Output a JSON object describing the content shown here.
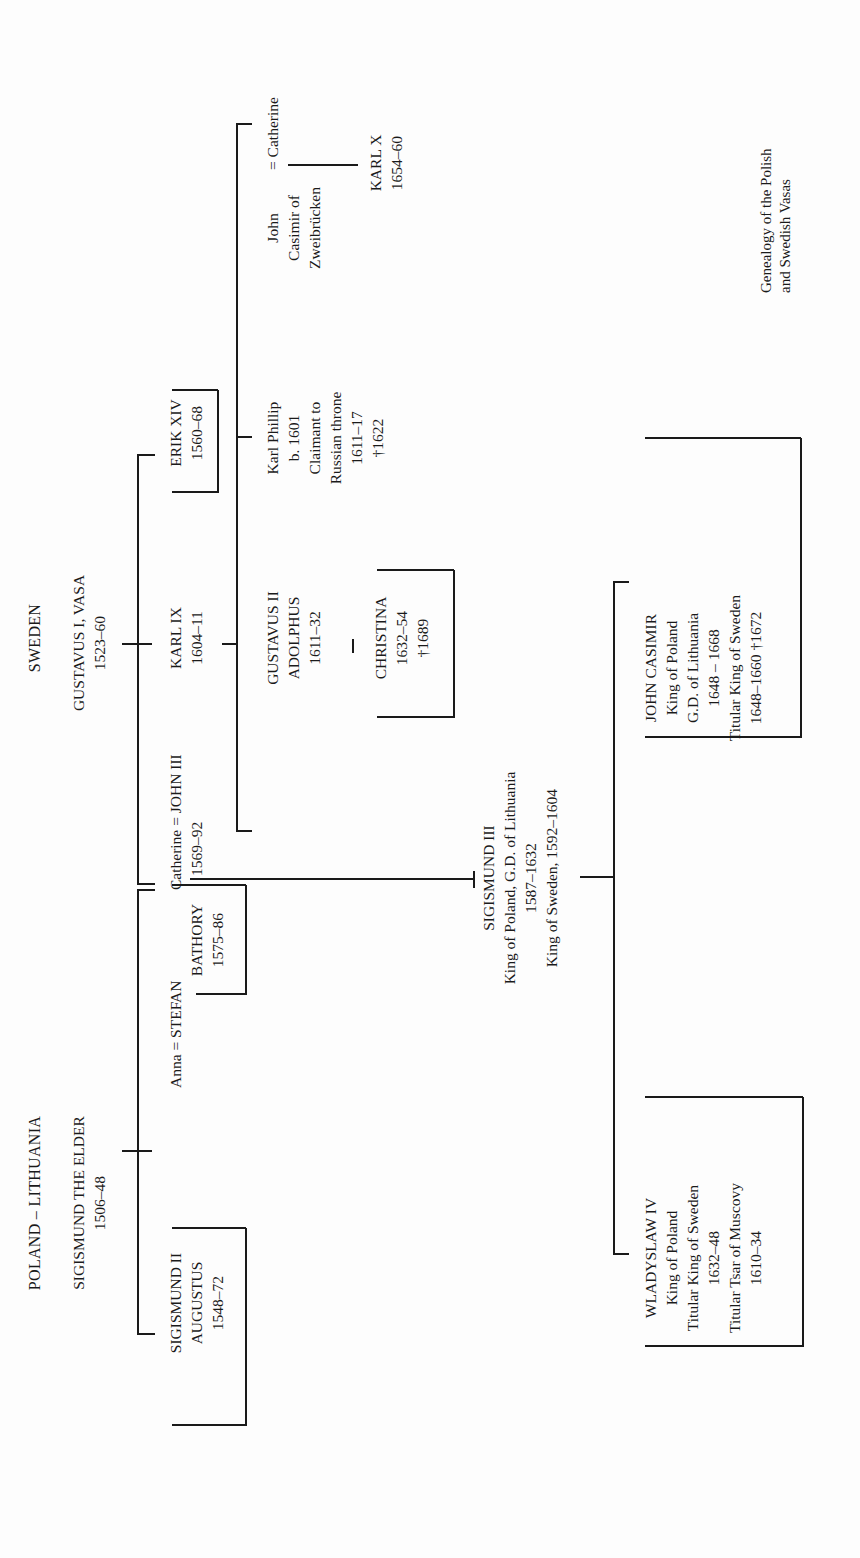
{
  "caption": [
    "Genealogy of the Polish",
    "and Swedish Vasas"
  ],
  "houses": {
    "poland": {
      "title": "POLAND – LITHUANIA",
      "founder": {
        "name": "SIGISMUND THE ELDER",
        "reign": "1506–48"
      }
    },
    "sweden": {
      "title": "SWEDEN",
      "founder": {
        "name": "GUSTAVUS I, VASA",
        "reign": "1523–60"
      }
    }
  },
  "persons": {
    "sigismund_ii": {
      "lines": [
        "SIGISMUND II",
        "AUGUSTUS",
        "1548–72"
      ],
      "boxed": true
    },
    "anna_stefan": {
      "spouse": "Anna",
      "eq": "=",
      "lines": [
        "STEFAN",
        "BATHORY",
        "1575–86"
      ],
      "boxed": true
    },
    "catherine_john": {
      "spouse": "Catherine",
      "eq": "=",
      "name": "JOHN III",
      "reign": "1569–92"
    },
    "karl_ix": {
      "lines": [
        "KARL IX",
        "1604–11"
      ]
    },
    "erik_xiv": {
      "lines": [
        "ERIK XIV",
        "1560–68"
      ],
      "boxed": true
    },
    "gustavus_ii": {
      "lines": [
        "GUSTAVUS II",
        "ADOLPHUS",
        "1611–32"
      ]
    },
    "christina": {
      "lines": [
        "CHRISTINA",
        "1632–54",
        "†1689"
      ],
      "boxed": true
    },
    "karl_phillip": {
      "lines": [
        "Karl Phillip",
        "b. 1601",
        "Claimant to",
        "Russian throne",
        "1611–17",
        "†1622"
      ]
    },
    "john_casimir_zw": {
      "lines": [
        "John",
        "Casimir of",
        "Zweibrücken"
      ]
    },
    "catherine_2": {
      "eq": "=",
      "name": "Catherine"
    },
    "karl_x": {
      "lines": [
        "KARL X",
        "1654–60"
      ]
    },
    "sigismund_iii": {
      "lines": [
        "SIGISMUND III",
        "King of Poland, G.D. of Lithuania",
        "1587–1632",
        "King of Sweden, 1592–1604"
      ]
    },
    "wladyslaw_iv": {
      "lines": [
        "WLADYSLAW IV",
        "King of Poland",
        "Titular King of Sweden",
        "1632–48",
        "Titular Tsar of Muscovy",
        "1610–34"
      ],
      "boxed": true
    },
    "john_casimir": {
      "lines": [
        "JOHN CASIMIR",
        "King of Poland",
        "G.D. of Lithuania",
        "1648 – 1668",
        "Titular King of Sweden",
        "1648–1660 †1672"
      ],
      "boxed": true
    }
  }
}
